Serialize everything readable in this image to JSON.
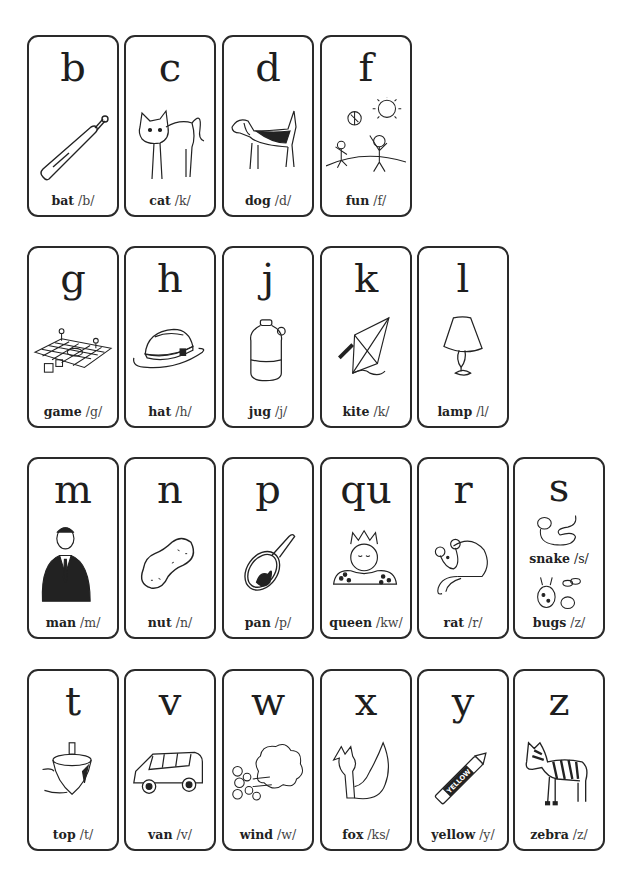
{
  "cards": [
    {
      "letter": "b",
      "word": "bat",
      "phoneme": "/b/",
      "icon": "bat-icon",
      "row": 0,
      "col": 0
    },
    {
      "letter": "c",
      "word": "cat",
      "phoneme": "/k/",
      "icon": "cat-icon",
      "row": 0,
      "col": 1
    },
    {
      "letter": "d",
      "word": "dog",
      "phoneme": "/d/",
      "icon": "dog-icon",
      "row": 0,
      "col": 2
    },
    {
      "letter": "f",
      "word": "fun",
      "phoneme": "/f/",
      "icon": "children-playing-icon",
      "row": 0,
      "col": 3
    },
    {
      "letter": "g",
      "word": "game",
      "phoneme": "/g/",
      "icon": "board-game-icon",
      "row": 1,
      "col": 0
    },
    {
      "letter": "h",
      "word": "hat",
      "phoneme": "/h/",
      "icon": "hat-icon",
      "row": 1,
      "col": 1
    },
    {
      "letter": "j",
      "word": "jug",
      "phoneme": "/j/",
      "icon": "jug-icon",
      "row": 1,
      "col": 2
    },
    {
      "letter": "k",
      "word": "kite",
      "phoneme": "/k/",
      "icon": "kite-icon",
      "row": 1,
      "col": 3
    },
    {
      "letter": "l",
      "word": "lamp",
      "phoneme": "/l/",
      "icon": "lamp-icon",
      "row": 1,
      "col": 4
    },
    {
      "letter": "m",
      "word": "man",
      "phoneme": "/m/",
      "icon": "man-icon",
      "row": 2,
      "col": 0
    },
    {
      "letter": "n",
      "word": "nut",
      "phoneme": "/n/",
      "icon": "peanut-icon",
      "row": 2,
      "col": 1
    },
    {
      "letter": "p",
      "word": "pan",
      "phoneme": "/p/",
      "icon": "pan-icon",
      "row": 2,
      "col": 2
    },
    {
      "letter": "qu",
      "word": "queen",
      "phoneme": "/kw/",
      "icon": "queen-icon",
      "row": 2,
      "col": 3
    },
    {
      "letter": "r",
      "word": "rat",
      "phoneme": "/r/",
      "icon": "rat-icon",
      "row": 2,
      "col": 4
    },
    {
      "letter": "s",
      "word": "snake",
      "phoneme": "/s/",
      "word2": "bugs",
      "phoneme2": "/z/",
      "icon": "snake-icon",
      "icon2": "bugs-icon",
      "row": 2,
      "col": 5
    },
    {
      "letter": "t",
      "word": "top",
      "phoneme": "/t/",
      "icon": "spinning-top-icon",
      "row": 3,
      "col": 0
    },
    {
      "letter": "v",
      "word": "van",
      "phoneme": "/v/",
      "icon": "van-icon",
      "row": 3,
      "col": 1
    },
    {
      "letter": "w",
      "word": "wind",
      "phoneme": "/w/",
      "icon": "wind-icon",
      "row": 3,
      "col": 2
    },
    {
      "letter": "x",
      "word": "fox",
      "phoneme": "/ks/",
      "icon": "fox-icon",
      "row": 3,
      "col": 3
    },
    {
      "letter": "y",
      "word": "yellow",
      "phoneme": "/y/",
      "icon": "crayon-icon",
      "crayon_label": "YELLOW",
      "row": 3,
      "col": 4
    },
    {
      "letter": "z",
      "word": "zebra",
      "phoneme": "/z/",
      "icon": "zebra-icon",
      "row": 3,
      "col": 5
    }
  ],
  "layout": {
    "col_x": [
      27,
      124,
      222,
      320,
      417,
      513
    ],
    "row_y": [
      35,
      246,
      457,
      669
    ]
  }
}
